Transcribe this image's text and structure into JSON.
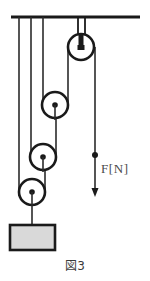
{
  "figure": {
    "caption": "図3",
    "force_label": "F[N]",
    "title_semantics": "compound-pulley-system-diagram"
  },
  "colors": {
    "ink": "#1a1a1a",
    "rope": "#2b2b2b",
    "weight_fill": "#d9d9d9",
    "weight_stroke": "#1a1a1a",
    "label_text": "#4a4a4a",
    "caption_text": "#3b3b3b",
    "background": "#ffffff"
  },
  "diagram": {
    "ceiling": {
      "label": "ceiling-bar",
      "x1": 11,
      "x2": 140,
      "y": 17,
      "thickness": 3
    },
    "anchor_ropes": [
      {
        "name": "anchor-rope-1",
        "x": 19,
        "y1": 17,
        "y2": 196
      },
      {
        "name": "anchor-rope-2",
        "x": 31,
        "y1": 17,
        "y2": 162
      },
      {
        "name": "anchor-rope-3",
        "x": 43,
        "y1": 17,
        "y2": 110
      }
    ],
    "fixed_pulley": {
      "name": "fixed-pulley",
      "cx": 81,
      "cy": 47,
      "r": 13,
      "bracket": {
        "x1": 78,
        "x2": 85,
        "y_top": 17,
        "y_bottom": 47
      },
      "hub_type": "square-axle"
    },
    "movable_pulleys": [
      {
        "name": "movable-pulley-1",
        "cx": 55,
        "cy": 105,
        "r": 13,
        "hub_r": 2.6
      },
      {
        "name": "movable-pulley-2",
        "cx": 43,
        "cy": 157,
        "r": 13,
        "hub_r": 2.6
      },
      {
        "name": "movable-pulley-3",
        "cx": 32,
        "cy": 192,
        "r": 13,
        "hub_r": 2.6
      }
    ],
    "rope_segments": [
      {
        "name": "rope-fixed-to-movable-1",
        "x": 68,
        "y1": 47,
        "y2": 105
      },
      {
        "name": "rope-movable-1-to-movable-2",
        "x": 56,
        "y1": 105,
        "y2": 157
      },
      {
        "name": "rope-movable-2-to-movable-3",
        "x": 45,
        "y1": 157,
        "y2": 192
      }
    ],
    "load_rope": {
      "name": "load-rope",
      "x": 32,
      "y1": 192,
      "y2": 225
    },
    "weight_block": {
      "name": "weight-block",
      "x": 10,
      "y": 225,
      "width": 45,
      "height": 25,
      "fill": "#d9d9d9"
    },
    "force_arrow": {
      "name": "force-arrow",
      "x": 95,
      "y_rope_top": 47,
      "y_dot": 155,
      "y_tip": 196,
      "dot_r": 3,
      "direction": "down"
    }
  }
}
